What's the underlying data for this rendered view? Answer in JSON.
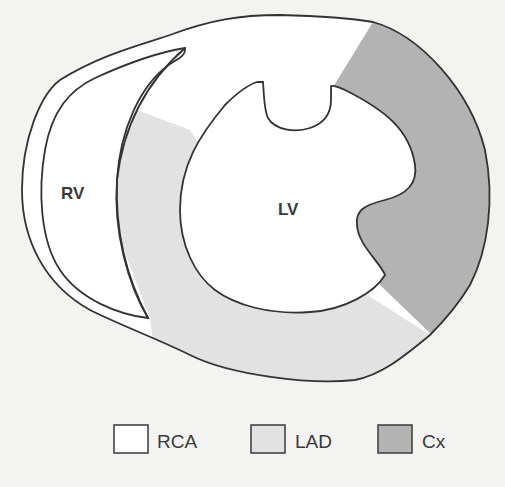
{
  "diagram": {
    "labels": {
      "rv": "RV",
      "lv": "LV"
    },
    "colors": {
      "background": "#f3f3f2",
      "outline": "#333333",
      "rca": "#ffffff",
      "lad": "#e2e2e2",
      "cx": "#b3b3b3"
    },
    "legend": [
      {
        "key": "rca",
        "label": "RCA",
        "color": "#ffffff"
      },
      {
        "key": "lad",
        "label": "LAD",
        "color": "#e2e2e2"
      },
      {
        "key": "cx",
        "label": "Cx",
        "color": "#b3b3b3"
      }
    ]
  }
}
